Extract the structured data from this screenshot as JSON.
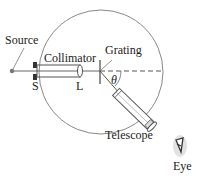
{
  "diagram": {
    "labels": {
      "source": "Source",
      "collimator": "Collimator",
      "grating": "Grating",
      "slit": "S",
      "lens": "L",
      "angle": "θ",
      "telescope": "Telescope",
      "eye": "Eye"
    },
    "colors": {
      "line": "#555555",
      "circle": "#888888",
      "text": "#222222",
      "shadow": "#cccccc"
    }
  }
}
